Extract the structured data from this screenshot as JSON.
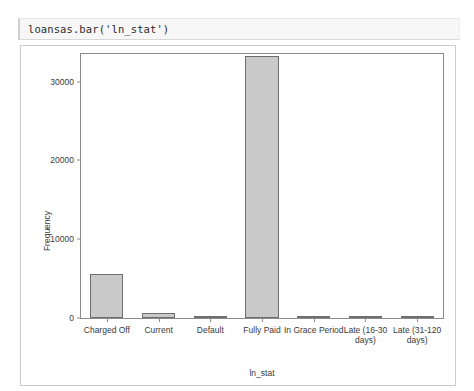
{
  "code_cell": {
    "code": "loansas.bar('ln_stat')"
  },
  "chart_data": {
    "type": "bar",
    "title": "",
    "xlabel": "ln_stat",
    "ylabel": "Frequency",
    "categories": [
      "Charged Off",
      "Current",
      "Default",
      "Fully Paid",
      "In Grace Period",
      "Late (16-30 days)",
      "Late (31-120 days)"
    ],
    "values": [
      5600,
      600,
      30,
      33200,
      40,
      60,
      120
    ],
    "ylim": [
      0,
      33500
    ],
    "yticks": [
      0,
      10000,
      20000,
      30000
    ],
    "ytick_labels": [
      "0",
      "10000",
      "20000",
      "30000"
    ],
    "grid": false,
    "legend": false,
    "bar_color": "#c9c9c9",
    "bar_edge_color": "#6e6e6e",
    "axis_color": "#8c8c8c"
  }
}
